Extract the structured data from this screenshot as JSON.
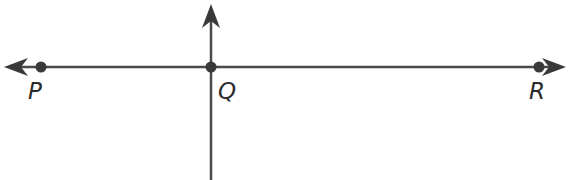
{
  "diagram": {
    "type": "geometry-lines",
    "stroke_color": "#4a4a4a",
    "point_color": "#3a3a3a",
    "horizontal_line": {
      "name": "line PR",
      "arrows": [
        "left",
        "right"
      ]
    },
    "vertical_ray": {
      "name": "ray from Q upward",
      "arrows": [
        "up"
      ]
    },
    "points": [
      {
        "label": "P",
        "x": 41,
        "y": 67
      },
      {
        "label": "Q",
        "x": 211,
        "y": 67
      },
      {
        "label": "R",
        "x": 539,
        "y": 67
      }
    ]
  }
}
